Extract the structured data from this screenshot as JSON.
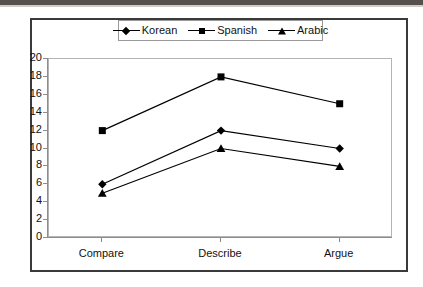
{
  "chart_data": {
    "type": "line",
    "title": "",
    "subtitle": "",
    "xlabel": "",
    "ylabel": "",
    "categories": [
      "Compare",
      "Describe",
      "Argue"
    ],
    "series": [
      {
        "name": "Korean",
        "marker": "diamond",
        "values": [
          6,
          12,
          10
        ]
      },
      {
        "name": "Spanish",
        "marker": "square",
        "values": [
          12,
          18,
          15
        ]
      },
      {
        "name": "Arabic",
        "marker": "triangle",
        "values": [
          5,
          10,
          8
        ]
      }
    ],
    "ylim": [
      0,
      20
    ],
    "ytick_step": 2,
    "yticks": [
      0,
      2,
      4,
      6,
      8,
      10,
      12,
      14,
      16,
      18,
      20
    ],
    "ytick_labels": [
      "0",
      "2",
      "4",
      "6",
      "8",
      "10",
      "12",
      "14",
      "16",
      "18",
      "20"
    ],
    "grid": false,
    "legend_position": "top-center",
    "line_color": "#000000",
    "marker_color": "#000000",
    "plot_border_color": "#b4b4b4",
    "frame_border_color": "#3a3a3a",
    "axis_color": "#8d8d8d",
    "background": "#ffffff"
  },
  "legend": {
    "entries": [
      {
        "label": "Korean",
        "marker": "diamond-marker-icon"
      },
      {
        "label": "Spanish",
        "marker": "square-marker-icon"
      },
      {
        "label": "Arabic",
        "marker": "triangle-marker-icon"
      }
    ]
  },
  "axes": {
    "y_labels": [
      "20",
      "18",
      "16",
      "14",
      "12",
      "10",
      "8",
      "6",
      "4",
      "2",
      "0"
    ],
    "x_labels": [
      "Compare",
      "Describe",
      "Argue"
    ]
  }
}
